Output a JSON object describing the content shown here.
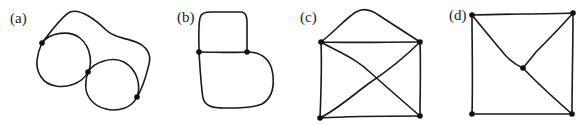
{
  "figure": {
    "panels": [
      {
        "id": "a",
        "label": "(a)",
        "vertices": 3,
        "description": "Two loops (circles) sharing a vertex, with an outer curved edge joining the outer vertices"
      },
      {
        "id": "b",
        "label": "(b)",
        "vertices": 2,
        "description": "Two vertices joined by a straight edge and two curved loops (multigraph with three edges)"
      },
      {
        "id": "c",
        "label": "(c)",
        "vertices": 4,
        "description": "Square with both diagonals and an arched extra edge on top (envelope shape)"
      },
      {
        "id": "d",
        "label": "(d)",
        "vertices": 5,
        "description": "Square with a center vertex connected to the top-left, top-right and bottom-right corners"
      }
    ],
    "colors": {
      "stroke": "#1a1a1a",
      "vertex": "#111111",
      "background": "#ffffff"
    }
  }
}
